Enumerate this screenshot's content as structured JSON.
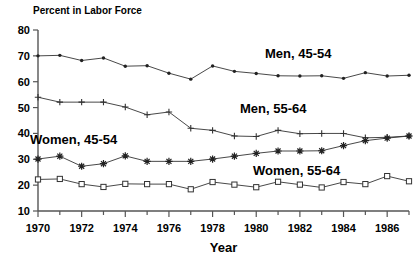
{
  "chart_data": {
    "type": "line",
    "title": "",
    "ylabel": "Percent in Labor Force",
    "xlabel": "Year",
    "ylim": [
      10,
      80
    ],
    "xlim": [
      1970,
      1987
    ],
    "yticks": [
      10,
      20,
      30,
      40,
      50,
      60,
      70,
      80
    ],
    "ytick_labels": [
      "10",
      "20",
      "30",
      "40",
      "50",
      "60",
      "70",
      "80"
    ],
    "xticks": [
      1970,
      1972,
      1974,
      1976,
      1978,
      1980,
      1982,
      1984,
      1986
    ],
    "xtick_labels": [
      "1970",
      "1972",
      "1974",
      "1976",
      "1978",
      "1980",
      "1982",
      "1984",
      "1986"
    ],
    "grid": false,
    "legend_position": "inline-annotations",
    "x": [
      1970,
      1971,
      1972,
      1973,
      1974,
      1975,
      1976,
      1977,
      1978,
      1979,
      1980,
      1981,
      1982,
      1983,
      1984,
      1985,
      1986,
      1987
    ],
    "series": [
      {
        "name": "Men, 45-54",
        "marker": "dot",
        "values": [
          70.0,
          70.2,
          68.2,
          69.2,
          66.0,
          66.2,
          63.3,
          61.0,
          66.1,
          64.0,
          63.2,
          62.3,
          62.2,
          62.3,
          61.3,
          63.5,
          62.2,
          62.5
        ]
      },
      {
        "name": "Men, 55-64",
        "marker": "plus",
        "values": [
          54.0,
          52.1,
          52.1,
          52.1,
          50.2,
          47.2,
          48.3,
          42.0,
          41.2,
          39.0,
          38.8,
          41.2,
          39.9,
          40.0,
          40.0,
          38.3,
          38.5,
          39.0
        ]
      },
      {
        "name": "Women, 45-54",
        "marker": "star",
        "values": [
          30.1,
          31.2,
          27.3,
          28.3,
          31.3,
          29.2,
          29.2,
          29.2,
          30.1,
          31.2,
          32.3,
          33.2,
          33.2,
          33.3,
          35.3,
          37.2,
          38.2,
          39.0
        ]
      },
      {
        "name": "Women, 55-64",
        "marker": "square",
        "values": [
          22.2,
          22.4,
          20.4,
          19.3,
          20.5,
          20.4,
          20.4,
          18.4,
          21.2,
          20.2,
          19.2,
          21.3,
          20.2,
          19.1,
          21.2,
          20.4,
          23.5,
          21.5
        ]
      }
    ],
    "annotations": [
      {
        "text": "Men, 45-54",
        "x_px": 265,
        "y_px": 58
      },
      {
        "text": "Men, 55-64",
        "x_px": 240,
        "y_px": 113
      },
      {
        "text": "Women, 45-54",
        "x_px": 30,
        "y_px": 144
      },
      {
        "text": "Women, 55-64",
        "x_px": 253,
        "y_px": 175
      }
    ]
  },
  "colors": {
    "background": "#ffffff",
    "line": "#333333",
    "axis": "#555555",
    "text": "#000000"
  }
}
